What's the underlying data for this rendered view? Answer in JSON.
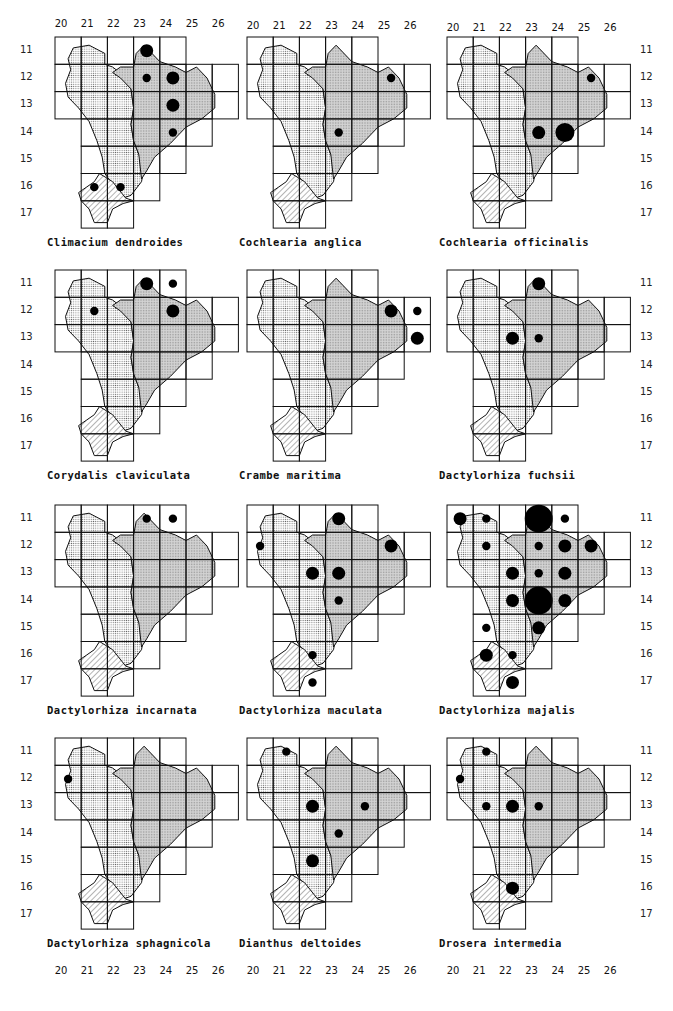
{
  "page": {
    "top_col_labels": [
      "20",
      "21",
      "22",
      "23",
      "24",
      "25",
      "26"
    ],
    "row_labels": [
      "11",
      "12",
      "13",
      "14",
      "15",
      "16",
      "17"
    ],
    "row_label_variant_panel4_row14": "14"
  },
  "chart_data": {
    "type": "scatter",
    "xlabel": "Grid column",
    "ylabel": "Grid row",
    "x_ticks": [
      20,
      21,
      22,
      23,
      24,
      25,
      26
    ],
    "y_ticks": [
      11,
      12,
      13,
      14,
      15,
      16,
      17
    ],
    "legend_note": "Dot size indicates relative abundance (s=small, m=medium, l=large, xl=very large)",
    "maps": [
      {
        "name": "Climacium dendroides",
        "points": [
          {
            "x": 23,
            "y": 11,
            "size": "m"
          },
          {
            "x": 23,
            "y": 12,
            "size": "s"
          },
          {
            "x": 24,
            "y": 12,
            "size": "m"
          },
          {
            "x": 24,
            "y": 13,
            "size": "m"
          },
          {
            "x": 24,
            "y": 14,
            "size": "s"
          },
          {
            "x": 21,
            "y": 16,
            "size": "s"
          },
          {
            "x": 22,
            "y": 16,
            "size": "s"
          }
        ]
      },
      {
        "name": "Cochlearia anglica",
        "points": [
          {
            "x": 25,
            "y": 12,
            "size": "s"
          },
          {
            "x": 23,
            "y": 14,
            "size": "s"
          }
        ]
      },
      {
        "name": "Cochlearia officinalis",
        "points": [
          {
            "x": 25,
            "y": 12,
            "size": "s"
          },
          {
            "x": 23,
            "y": 14,
            "size": "m"
          },
          {
            "x": 24,
            "y": 14,
            "size": "l"
          }
        ]
      },
      {
        "name": "Corydalis claviculata",
        "points": [
          {
            "x": 23,
            "y": 11,
            "size": "m"
          },
          {
            "x": 24,
            "y": 11,
            "size": "s"
          },
          {
            "x": 21,
            "y": 12,
            "size": "s"
          },
          {
            "x": 24,
            "y": 12,
            "size": "m"
          }
        ]
      },
      {
        "name": "Crambe maritima",
        "points": [
          {
            "x": 25,
            "y": 12,
            "size": "m"
          },
          {
            "x": 26,
            "y": 12,
            "size": "s"
          },
          {
            "x": 26,
            "y": 13,
            "size": "m"
          }
        ]
      },
      {
        "name": "Dactylorhiza fuchsii",
        "points": [
          {
            "x": 23,
            "y": 11,
            "size": "m"
          },
          {
            "x": 22,
            "y": 13,
            "size": "m"
          },
          {
            "x": 23,
            "y": 13,
            "size": "s"
          }
        ]
      },
      {
        "name": "Dactylorhiza incarnata",
        "points": [
          {
            "x": 23,
            "y": 11,
            "size": "s"
          },
          {
            "x": 24,
            "y": 11,
            "size": "s"
          }
        ]
      },
      {
        "name": "Dactylorhiza maculata",
        "points": [
          {
            "x": 23,
            "y": 11,
            "size": "m"
          },
          {
            "x": 20,
            "y": 12,
            "size": "s"
          },
          {
            "x": 25,
            "y": 12,
            "size": "m"
          },
          {
            "x": 22,
            "y": 13,
            "size": "m"
          },
          {
            "x": 23,
            "y": 13,
            "size": "m"
          },
          {
            "x": 23,
            "y": 14,
            "size": "s"
          },
          {
            "x": 22,
            "y": 16,
            "size": "s"
          },
          {
            "x": 22,
            "y": 17,
            "size": "s"
          }
        ]
      },
      {
        "name": "Dactylorhiza majalis",
        "points": [
          {
            "x": 20,
            "y": 11,
            "size": "m"
          },
          {
            "x": 21,
            "y": 11,
            "size": "s"
          },
          {
            "x": 23,
            "y": 11,
            "size": "xl"
          },
          {
            "x": 24,
            "y": 11,
            "size": "s"
          },
          {
            "x": 21,
            "y": 12,
            "size": "s"
          },
          {
            "x": 23,
            "y": 12,
            "size": "s"
          },
          {
            "x": 24,
            "y": 12,
            "size": "m"
          },
          {
            "x": 25,
            "y": 12,
            "size": "m"
          },
          {
            "x": 22,
            "y": 13,
            "size": "m"
          },
          {
            "x": 23,
            "y": 13,
            "size": "s"
          },
          {
            "x": 24,
            "y": 13,
            "size": "m"
          },
          {
            "x": 22,
            "y": 14,
            "size": "m"
          },
          {
            "x": 23,
            "y": 14,
            "size": "xl"
          },
          {
            "x": 24,
            "y": 14,
            "size": "m"
          },
          {
            "x": 21,
            "y": 15,
            "size": "s"
          },
          {
            "x": 23,
            "y": 15,
            "size": "m"
          },
          {
            "x": 21,
            "y": 16,
            "size": "m"
          },
          {
            "x": 22,
            "y": 16,
            "size": "s"
          },
          {
            "x": 22,
            "y": 17,
            "size": "m"
          }
        ]
      },
      {
        "name": "Dactylorhiza sphagnicola",
        "points": [
          {
            "x": 20,
            "y": 12,
            "size": "s"
          }
        ]
      },
      {
        "name": "Dianthus deltoides",
        "points": [
          {
            "x": 21,
            "y": 11,
            "size": "s"
          },
          {
            "x": 22,
            "y": 13,
            "size": "m"
          },
          {
            "x": 24,
            "y": 13,
            "size": "s"
          },
          {
            "x": 23,
            "y": 14,
            "size": "s"
          },
          {
            "x": 22,
            "y": 15,
            "size": "m"
          }
        ]
      },
      {
        "name": "Drosera intermedia",
        "points": [
          {
            "x": 21,
            "y": 11,
            "size": "s"
          },
          {
            "x": 20,
            "y": 12,
            "size": "s"
          },
          {
            "x": 21,
            "y": 13,
            "size": "s"
          },
          {
            "x": 22,
            "y": 13,
            "size": "m"
          },
          {
            "x": 23,
            "y": 13,
            "size": "s"
          },
          {
            "x": 22,
            "y": 16,
            "size": "m"
          }
        ]
      }
    ]
  }
}
